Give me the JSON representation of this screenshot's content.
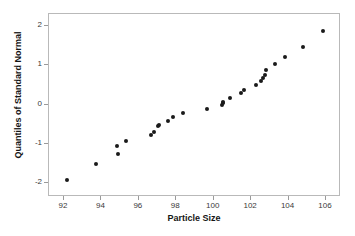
{
  "chart_data": {
    "type": "scatter",
    "title": "",
    "xlabel": "Particle Size",
    "ylabel": "Quantiles of Standard Normal",
    "xlim": [
      91.2,
      106.8
    ],
    "ylim": [
      -2.35,
      2.3
    ],
    "grid": false,
    "legend": null,
    "xticks": [
      92,
      94,
      96,
      98,
      100,
      102,
      104,
      106
    ],
    "xtick_labels": [
      "92",
      "94",
      "96",
      "98",
      "100",
      "102",
      "104",
      "106"
    ],
    "yticks": [
      2,
      1,
      0,
      -1,
      -2
    ],
    "ytick_labels": [
      "2",
      "1",
      "0",
      "-1",
      "-2"
    ],
    "marker_color": "#1a1a1a",
    "frame_color": "#b9b9b9",
    "background_color": "#ffffff",
    "n_points": 31,
    "x": [
      92.17,
      93.69,
      94.85,
      94.9,
      95.3,
      96.65,
      96.82,
      97.45,
      97.82,
      98.35,
      99.62,
      100.45,
      100.48,
      100.82,
      101.45,
      101.62,
      102.25,
      102.55,
      102.62,
      102.72,
      103.05,
      103.3,
      103.82,
      104.75,
      105.85,
      97.1,
      101.1,
      100.55,
      102.4,
      99.1,
      95.95
    ],
    "y": [
      -1.93,
      -1.51,
      -1.06,
      -1.26,
      -0.92,
      -0.78,
      -0.71,
      -0.55,
      -0.53,
      -0.42,
      -0.31,
      -0.21,
      -0.12,
      -0.01,
      0.01,
      0.05,
      0.16,
      0.28,
      0.37,
      0.49,
      0.61,
      0.67,
      0.75,
      0.88,
      1.02,
      -0.63,
      0.1,
      0.0,
      0.44,
      -0.26,
      -0.85
    ],
    "points": [
      {
        "x": 92.17,
        "y": -1.93
      },
      {
        "x": 93.69,
        "y": -1.51
      },
      {
        "x": 94.85,
        "y": -1.06
      },
      {
        "x": 94.9,
        "y": -1.26
      },
      {
        "x": 95.3,
        "y": -0.92
      },
      {
        "x": 96.65,
        "y": -0.78
      },
      {
        "x": 96.82,
        "y": -0.71
      },
      {
        "x": 97.0,
        "y": -0.55
      },
      {
        "x": 97.08,
        "y": -0.53
      },
      {
        "x": 97.55,
        "y": -0.42
      },
      {
        "x": 97.85,
        "y": -0.31
      },
      {
        "x": 98.35,
        "y": -0.21
      },
      {
        "x": 99.62,
        "y": -0.12
      },
      {
        "x": 100.45,
        "y": -0.01
      },
      {
        "x": 100.48,
        "y": 0.03
      },
      {
        "x": 100.52,
        "y": 0.06
      },
      {
        "x": 100.85,
        "y": 0.16
      },
      {
        "x": 101.48,
        "y": 0.28
      },
      {
        "x": 101.62,
        "y": 0.37
      },
      {
        "x": 102.25,
        "y": 0.49
      },
      {
        "x": 102.55,
        "y": 0.61
      },
      {
        "x": 102.62,
        "y": 0.67
      },
      {
        "x": 102.72,
        "y": 0.75
      },
      {
        "x": 102.78,
        "y": 0.88
      },
      {
        "x": 103.25,
        "y": 1.02
      },
      {
        "x": 103.82,
        "y": 1.22
      },
      {
        "x": 104.78,
        "y": 1.46
      },
      {
        "x": 105.85,
        "y": 1.86
      }
    ]
  }
}
